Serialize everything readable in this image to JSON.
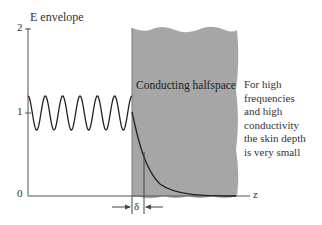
{
  "diagram": {
    "y_axis_label": "E envelope",
    "x_axis_label": "z",
    "y_ticks": [
      "2",
      "1",
      "0"
    ],
    "region_label": "Conducting halfspace",
    "delta_label": "δ",
    "note_lines": [
      "For high",
      "frequencies",
      "and high",
      "conductivity",
      "the skin depth",
      "is very small"
    ],
    "colors": {
      "region_fill": "#a6a6a6",
      "curve": "#222222",
      "axis": "#555555"
    }
  }
}
